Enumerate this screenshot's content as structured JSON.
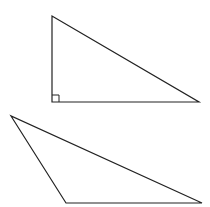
{
  "diagram": {
    "stroke_color": "#222222",
    "background": "#ffffff",
    "shapes": [
      {
        "id": "right-triangle",
        "type": "triangle",
        "points": [
          [
            52,
            16
          ],
          [
            52,
            102
          ],
          [
            199,
            102
          ]
        ],
        "right_angle_marker": {
          "vertex": [
            52,
            102
          ],
          "size": 7
        }
      },
      {
        "id": "obtuse-triangle",
        "type": "triangle",
        "points": [
          [
            11,
            116
          ],
          [
            66,
            203
          ],
          [
            202,
            203
          ]
        ]
      }
    ]
  }
}
